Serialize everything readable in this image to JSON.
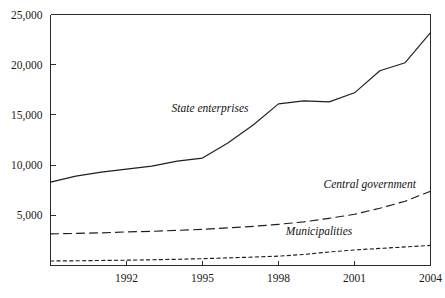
{
  "chart_data": {
    "type": "line",
    "title": "",
    "subtitle": "",
    "xlabel": "",
    "ylabel": "",
    "xlim": [
      1989,
      2004
    ],
    "ylim": [
      0,
      25000
    ],
    "grid": false,
    "legend_position": "inline-labels",
    "y_ticks": [
      0,
      5000,
      10000,
      15000,
      20000,
      25000
    ],
    "y_tick_labels": [
      "",
      "5,000",
      "10,000",
      "15,000",
      "20,000",
      "25,000"
    ],
    "x_ticks": [
      1992,
      1995,
      1998,
      2001,
      2004
    ],
    "x_tick_labels": [
      "1992",
      "1995",
      "1998",
      "2001",
      "2004"
    ],
    "x": [
      1989,
      1990,
      1991,
      1992,
      1993,
      1994,
      1995,
      1996,
      1997,
      1998,
      1999,
      2000,
      2001,
      2002,
      2003,
      2004
    ],
    "series": [
      {
        "name": "State enterprises",
        "style": "solid",
        "label_x": 1995.3,
        "label_y": 15300,
        "values": [
          8300,
          8900,
          9300,
          9600,
          9900,
          10400,
          10700,
          12200,
          14000,
          16100,
          16400,
          16300,
          17200,
          19400,
          20200,
          23200
        ]
      },
      {
        "name": "Central government",
        "style": "dashed",
        "label_x": 2001.6,
        "label_y": 7700,
        "values": [
          3150,
          3200,
          3250,
          3350,
          3400,
          3500,
          3600,
          3750,
          3900,
          4100,
          4350,
          4700,
          5100,
          5700,
          6400,
          7400
        ]
      },
      {
        "name": "Municipalities",
        "style": "dotted",
        "label_x": 1999.6,
        "label_y": 3050,
        "values": [
          450,
          470,
          500,
          530,
          570,
          620,
          680,
          760,
          840,
          930,
          1100,
          1350,
          1550,
          1700,
          1850,
          2000
        ]
      }
    ]
  }
}
